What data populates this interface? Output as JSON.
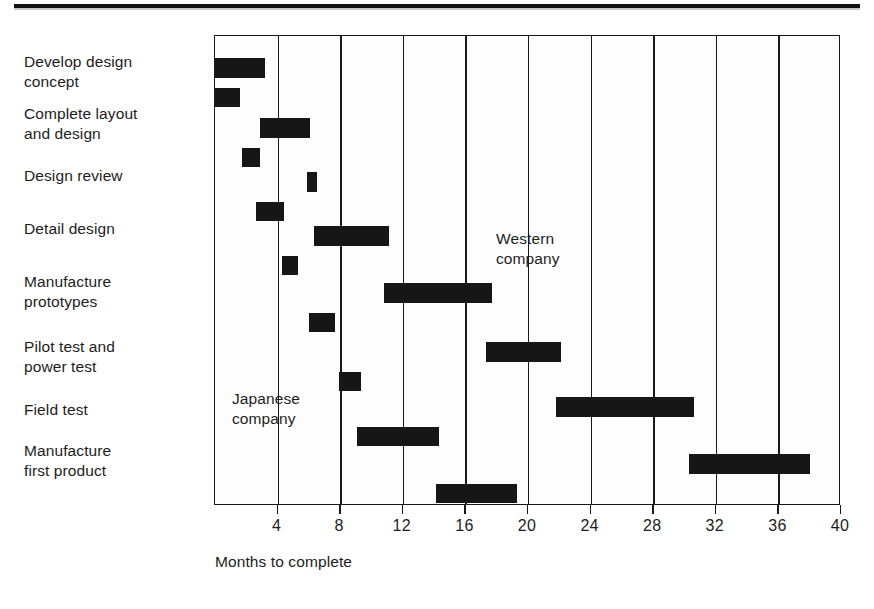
{
  "figure": {
    "x_axis_title": "Months to complete",
    "row_labels": [
      "Develop design\nconcept",
      "Complete layout\nand design",
      "Design review",
      "Detail design",
      "Manufacture\nprototypes",
      "Pilot test and\npower test",
      "Field test",
      "Manufacture\nfirst product"
    ],
    "annotations": {
      "western": "Western\ncompany",
      "japanese": "Japanese\ncompany"
    },
    "tick_labels": [
      "4",
      "8",
      "12",
      "16",
      "20",
      "24",
      "28",
      "32",
      "36",
      "40"
    ],
    "colors": {
      "bar": "#161616",
      "axis": "#1a1a1a",
      "background": "#ffffff",
      "rule": "#111111"
    }
  },
  "chart_data": {
    "type": "bar",
    "chart_subtype": "gantt",
    "title": "",
    "xlabel": "Months to complete",
    "ylabel": "",
    "xlim": [
      0,
      40
    ],
    "xticks": [
      4,
      8,
      12,
      16,
      20,
      24,
      28,
      32,
      36,
      40
    ],
    "grid": true,
    "grid_axis": "x",
    "legend": [
      "Western company",
      "Japanese company"
    ],
    "legend_position": "in-plot annotations",
    "categories": [
      "Develop design concept",
      "Complete layout and design",
      "Design review",
      "Detail design",
      "Manufacture prototypes",
      "Pilot test and power test",
      "Field test",
      "Manufacture first product"
    ],
    "series": [
      {
        "name": "Western company",
        "unit": "months",
        "bars": [
          {
            "category": "Develop design concept",
            "start": 0.0,
            "end": 3.2,
            "duration": 3.2
          },
          {
            "category": "Complete layout and design",
            "start": 2.9,
            "end": 6.1,
            "duration": 3.2
          },
          {
            "category": "Design review",
            "start": 5.9,
            "end": 6.5,
            "duration": 0.6
          },
          {
            "category": "Detail design",
            "start": 6.3,
            "end": 11.1,
            "duration": 4.8
          },
          {
            "category": "Manufacture prototypes",
            "start": 10.8,
            "end": 17.7,
            "duration": 6.9
          },
          {
            "category": "Pilot test and power test",
            "start": 17.3,
            "end": 22.1,
            "duration": 4.8
          },
          {
            "category": "Field test",
            "start": 21.8,
            "end": 30.6,
            "duration": 8.8
          },
          {
            "category": "Manufacture first product",
            "start": 30.3,
            "end": 38.0,
            "duration": 7.7
          }
        ]
      },
      {
        "name": "Japanese company",
        "unit": "months",
        "bars": [
          {
            "category": "Develop design concept",
            "start": 0.0,
            "end": 1.6,
            "duration": 1.6
          },
          {
            "category": "Complete layout and design",
            "start": 1.7,
            "end": 2.9,
            "duration": 1.2
          },
          {
            "category": "Design review",
            "start": 2.6,
            "end": 4.4,
            "duration": 1.8
          },
          {
            "category": "Detail design",
            "start": 4.3,
            "end": 5.3,
            "duration": 1.0
          },
          {
            "category": "Manufacture prototypes",
            "start": 6.0,
            "end": 7.7,
            "duration": 1.7
          },
          {
            "category": "Pilot test and power test",
            "start": 7.9,
            "end": 9.3,
            "duration": 1.4
          },
          {
            "category": "Field test",
            "start": 9.1,
            "end": 14.3,
            "duration": 5.2
          },
          {
            "category": "Manufacture first product",
            "start": 14.1,
            "end": 19.3,
            "duration": 5.2
          }
        ]
      }
    ]
  }
}
